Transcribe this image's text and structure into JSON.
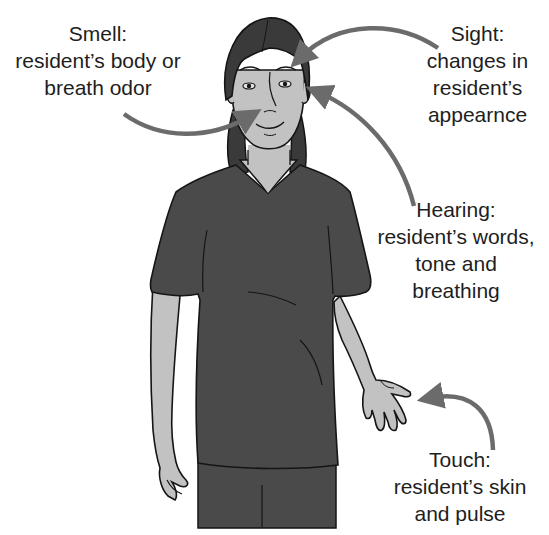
{
  "figure": {
    "colors": {
      "background": "#ffffff",
      "text": "#1e1e1e",
      "arrow": "#6b6b6b",
      "shirt": "#4a4a4a",
      "hair": "#3a3a3a",
      "skin": "#bdbdbd",
      "outline": "#151515"
    }
  },
  "labels": {
    "smell": {
      "title": "Smell:",
      "lines": [
        "resident’s body or",
        "breath odor"
      ]
    },
    "sight": {
      "title": "Sight:",
      "lines": [
        "changes in",
        "resident’s",
        "appearnce"
      ]
    },
    "hearing": {
      "title": "Hearing:",
      "lines": [
        "resident’s words,",
        "tone and",
        "breathing"
      ]
    },
    "touch": {
      "title": "Touch:",
      "lines": [
        "resident’s skin",
        "and pulse"
      ]
    }
  },
  "arrows": [
    {
      "name": "smell-arrow",
      "target": "nose"
    },
    {
      "name": "sight-arrow",
      "target": "eye"
    },
    {
      "name": "hearing-arrow",
      "target": "ear"
    },
    {
      "name": "touch-arrow",
      "target": "hand"
    }
  ]
}
